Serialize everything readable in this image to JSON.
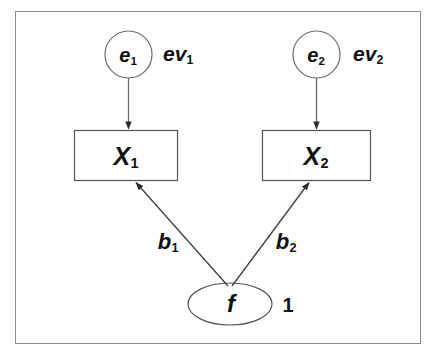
{
  "diagram": {
    "type": "path-diagram",
    "title": "",
    "frame": {
      "stroke": "#8d8d8d",
      "fill": "#ffffff"
    },
    "stroke_color": "#3a3a3a",
    "text_color": "#111111",
    "nodes": {
      "error1": {
        "label": "e",
        "subscript": "1",
        "shape": "circle"
      },
      "error2": {
        "label": "e",
        "subscript": "2",
        "shape": "circle"
      },
      "indicator1": {
        "label": "X",
        "subscript": "1",
        "shape": "rectangle"
      },
      "indicator2": {
        "label": "X",
        "subscript": "2",
        "shape": "rectangle"
      },
      "factor": {
        "label": "f",
        "subscript": "",
        "shape": "ellipse"
      }
    },
    "parameters": {
      "error_variance1": {
        "label": "ev",
        "subscript": "1"
      },
      "error_variance2": {
        "label": "ev",
        "subscript": "2"
      },
      "loading1": {
        "label": "b",
        "subscript": "1"
      },
      "loading2": {
        "label": "b",
        "subscript": "2"
      },
      "factor_variance": {
        "label": "1",
        "subscript": ""
      }
    },
    "edges": [
      {
        "from": "error1",
        "to": "indicator1",
        "label": "",
        "style": "straight-arrow"
      },
      {
        "from": "error2",
        "to": "indicator2",
        "label": "",
        "style": "straight-arrow"
      },
      {
        "from": "factor",
        "to": "indicator1",
        "label": "b1",
        "style": "straight-arrow"
      },
      {
        "from": "factor",
        "to": "indicator2",
        "label": "b2",
        "style": "straight-arrow"
      }
    ]
  }
}
